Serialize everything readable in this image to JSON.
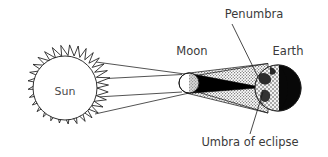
{
  "diagram": {
    "background_color": "#ffffff",
    "stroke_color": "#1a1a1a",
    "labels": {
      "sun": "Sun",
      "moon": "Moon",
      "earth": "Earth",
      "penumbra": "Penumbra",
      "umbra": "Umbra of eclipse"
    },
    "bodies": [
      {
        "name": "sun",
        "label": "Sun",
        "cx": 65,
        "cy": 88,
        "r": 32,
        "fill": "#ffffff",
        "corona": true,
        "corona_outer_r": 46
      },
      {
        "name": "moon",
        "label": "Moon",
        "cx": 189,
        "cy": 83,
        "r": 10,
        "lit_fill": "#ffffff",
        "shaded_fill": "#b9b9b9"
      },
      {
        "name": "earth",
        "label": "Earth",
        "cx": 278,
        "cy": 88,
        "r": 23,
        "day_fill": "#e8e8e8",
        "night_fill": "#0a0a0a"
      }
    ],
    "shadow_regions": [
      {
        "name": "penumbra",
        "label": "Penumbra",
        "fill": "#c9c9c9",
        "pattern": "stipple"
      },
      {
        "name": "umbra",
        "label": "Umbra of eclipse",
        "fill": "#000000",
        "pattern": "solid"
      }
    ],
    "light_rays": {
      "count": 4,
      "from": "sun",
      "to": "moon",
      "stroke": "#1a1a1a"
    },
    "label_positions": {
      "sun": {
        "x": 65,
        "y": 92
      },
      "moon": {
        "x": 192,
        "y": 55
      },
      "earth": {
        "x": 288,
        "y": 55
      },
      "penumbra": {
        "x": 254,
        "y": 18
      },
      "umbra": {
        "x": 250,
        "y": 144
      }
    },
    "leader_lines": [
      {
        "name": "penumbra-leader",
        "x1": 232,
        "y1": 24,
        "x2": 259,
        "y2": 79
      },
      {
        "name": "umbra-leader",
        "x1": 250,
        "y1": 134,
        "x2": 263,
        "y2": 92
      }
    ]
  }
}
